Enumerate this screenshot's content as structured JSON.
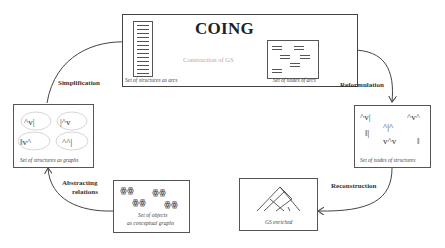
{
  "diagram": {
    "title": "COING",
    "main_box": {
      "left_node": {
        "caption": "Set of structures as arcs"
      },
      "right_node": {
        "caption": "Set of nodes of arcs"
      },
      "transition_label": "Construction of GS"
    },
    "nodes": [
      {
        "id": "structures-graphs",
        "caption": "Set of structures as graphs"
      },
      {
        "id": "nodes-structures",
        "caption": "Set of nodes of structures"
      },
      {
        "id": "conceptual-graphs",
        "caption_line1": "Set of objects",
        "caption_line2": "as conceptual graphs"
      },
      {
        "id": "gs-enriched",
        "caption": "GS enriched"
      }
    ],
    "edges": [
      {
        "label": "Simplification",
        "from": "structures-graphs",
        "to": "structures-arcs"
      },
      {
        "label": "Reformulation",
        "from": "nodes-arcs",
        "to": "nodes-structures"
      },
      {
        "label": "Reconstruction",
        "from": "nodes-structures",
        "to": "gs-enriched"
      },
      {
        "label_line1": "Abstracting",
        "label_line2": "relations",
        "from": "conceptual-graphs",
        "to": "structures-graphs"
      }
    ],
    "colors": {
      "stroke": "#555555",
      "text": "#333333",
      "muted_label": "#aaaaaa"
    }
  }
}
